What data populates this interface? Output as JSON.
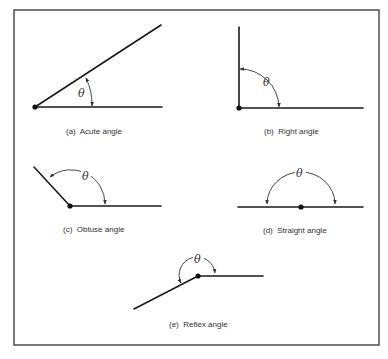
{
  "figure": {
    "angle_symbol": "θ",
    "panels": [
      {
        "id": "a",
        "label": "(a)",
        "name": "Acute angle",
        "caption": "(a)  Acute angle"
      },
      {
        "id": "b",
        "label": "(b)",
        "name": "Right angle",
        "caption": "(b)  Right angle"
      },
      {
        "id": "c",
        "label": "(c)",
        "name": "Obtuse angle",
        "caption": "(c)  Obtuse angle"
      },
      {
        "id": "d",
        "label": "(d)",
        "name": "Straight angle",
        "caption": "(d)  Straight angle"
      },
      {
        "id": "e",
        "label": "(e)",
        "name": "Reflex angle",
        "caption": "(e)  Reflex angle"
      }
    ]
  }
}
